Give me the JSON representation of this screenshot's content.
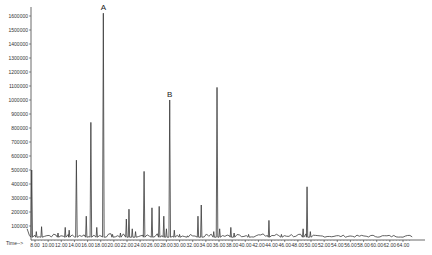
{
  "chart_data": {
    "type": "line",
    "title": "",
    "xlabel": "Time-->",
    "ylabel": "",
    "xlim": [
      6.0,
      66.0
    ],
    "ylim": [
      0,
      1650000
    ],
    "x_ticks": [
      "8.00",
      "10.00",
      "12.00",
      "14.00",
      "16.00",
      "18.00",
      "20.00",
      "22.00",
      "24.00",
      "26.00",
      "28.00",
      "30.00",
      "32.00",
      "34.00",
      "36.00",
      "38.00",
      "40.00",
      "42.00",
      "44.00",
      "46.00",
      "48.00",
      "50.00",
      "52.00",
      "54.00",
      "56.00",
      "58.00",
      "60.00",
      "62.00",
      "64.00"
    ],
    "y_ticks": [
      "100000",
      "200000",
      "300000",
      "400000",
      "500000",
      "600000",
      "700000",
      "800000",
      "900000",
      "1000000",
      "1100000",
      "1200000",
      "1300000",
      "1400000",
      "1500000",
      "1600000"
    ],
    "grid": false,
    "baseline": 20000,
    "series": [
      {
        "name": "TIC",
        "peaks": [
          {
            "x": 7.5,
            "y": 500000
          },
          {
            "x": 8.2,
            "y": 60000
          },
          {
            "x": 9.0,
            "y": 95000
          },
          {
            "x": 11.5,
            "y": 50000
          },
          {
            "x": 12.6,
            "y": 90000
          },
          {
            "x": 13.2,
            "y": 70000
          },
          {
            "x": 14.3,
            "y": 570000
          },
          {
            "x": 15.8,
            "y": 170000
          },
          {
            "x": 16.5,
            "y": 840000
          },
          {
            "x": 17.4,
            "y": 90000
          },
          {
            "x": 18.4,
            "y": 1620000,
            "label": "A"
          },
          {
            "x": 19.8,
            "y": 40000
          },
          {
            "x": 21.0,
            "y": 50000
          },
          {
            "x": 21.9,
            "y": 150000
          },
          {
            "x": 22.3,
            "y": 220000
          },
          {
            "x": 22.8,
            "y": 80000
          },
          {
            "x": 23.3,
            "y": 60000
          },
          {
            "x": 24.6,
            "y": 490000
          },
          {
            "x": 25.8,
            "y": 230000
          },
          {
            "x": 26.9,
            "y": 240000
          },
          {
            "x": 27.6,
            "y": 170000
          },
          {
            "x": 28.0,
            "y": 80000
          },
          {
            "x": 28.5,
            "y": 1000000,
            "label": "B"
          },
          {
            "x": 29.2,
            "y": 70000
          },
          {
            "x": 30.0,
            "y": 40000
          },
          {
            "x": 31.2,
            "y": 30000
          },
          {
            "x": 32.8,
            "y": 170000
          },
          {
            "x": 33.3,
            "y": 250000
          },
          {
            "x": 35.2,
            "y": 60000
          },
          {
            "x": 35.7,
            "y": 1090000
          },
          {
            "x": 36.1,
            "y": 80000
          },
          {
            "x": 37.8,
            "y": 90000
          },
          {
            "x": 38.3,
            "y": 50000
          },
          {
            "x": 40.5,
            "y": 40000
          },
          {
            "x": 43.6,
            "y": 140000
          },
          {
            "x": 45.5,
            "y": 40000
          },
          {
            "x": 48.8,
            "y": 80000
          },
          {
            "x": 49.4,
            "y": 380000
          },
          {
            "x": 49.9,
            "y": 60000
          }
        ]
      }
    ],
    "annotations": [
      {
        "text": "A",
        "x": 18.4,
        "y": 1620000
      },
      {
        "text": "B",
        "x": 28.5,
        "y": 1000000
      }
    ]
  }
}
